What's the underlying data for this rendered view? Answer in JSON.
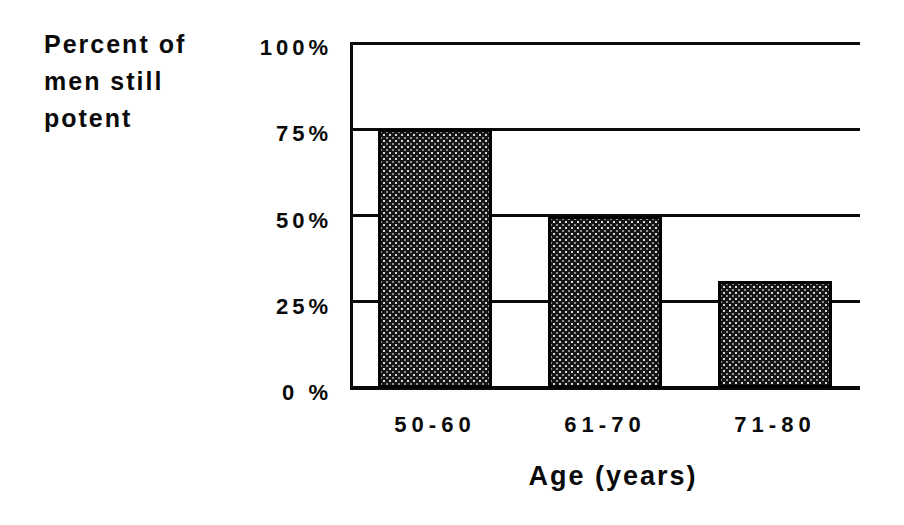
{
  "page": {
    "background": "#ffffff",
    "ink": "#0a0a0a"
  },
  "chart_data": {
    "type": "bar",
    "title": "",
    "ylabel": "Percent of men still potent",
    "ylabel_lines": [
      "Percent of",
      "men still",
      "potent"
    ],
    "xlabel": "Age (years)",
    "categories": [
      "50-60",
      "61-70",
      "71-80"
    ],
    "values": [
      75,
      50,
      31
    ],
    "y_ticks": [
      {
        "label": "100%",
        "value": 100
      },
      {
        "label": "75%",
        "value": 75
      },
      {
        "label": "50%",
        "value": 50
      },
      {
        "label": "25%",
        "value": 25
      },
      {
        "label": "0 %",
        "value": 0
      }
    ],
    "ylim": [
      0,
      100
    ],
    "grid": "horizontal",
    "legend_position": "none",
    "bar_style": {
      "fill": "dark-halftone-checker",
      "border_color": "#000000",
      "base_color": "#161616",
      "dot_color": "#d8d8d8"
    }
  }
}
